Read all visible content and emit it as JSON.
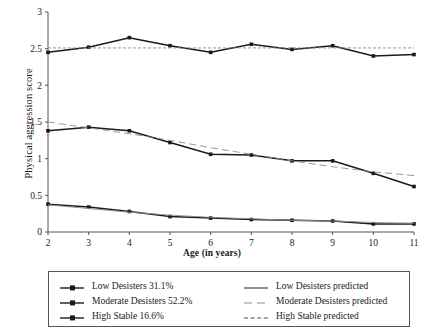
{
  "chart_data": {
    "type": "line",
    "title": "",
    "xlabel": "Age (in years)",
    "ylabel": "Physical aggression score",
    "x": [
      2,
      3,
      4,
      5,
      6,
      7,
      8,
      9,
      10,
      11
    ],
    "xticklabels": [
      "2",
      "3",
      "4",
      "5",
      "6",
      "7",
      "8",
      "9",
      "10",
      "11"
    ],
    "yticklabels": [
      "0",
      "0.5",
      "1",
      "1.5",
      "2",
      "2.5",
      "3"
    ],
    "yticks": [
      0,
      0.5,
      1,
      1.5,
      2,
      2.5,
      3
    ],
    "xlim": [
      2,
      11
    ],
    "ylim": [
      0,
      3
    ],
    "grid": false,
    "legend_position": "below-plot",
    "series": [
      {
        "name": "Low Desisters 31.1%",
        "style": "solid-with-markers",
        "marker": "square",
        "color": "#1a1a1a",
        "values": [
          0.38,
          0.34,
          0.28,
          0.21,
          0.19,
          0.17,
          0.16,
          0.15,
          0.11,
          0.11
        ]
      },
      {
        "name": "Moderate Desisters 52.2%",
        "style": "solid-with-markers",
        "marker": "square",
        "color": "#1a1a1a",
        "values": [
          1.38,
          1.43,
          1.38,
          1.22,
          1.06,
          1.05,
          0.97,
          0.97,
          0.8,
          0.62
        ]
      },
      {
        "name": "High Stable 16.6%",
        "style": "solid-with-markers",
        "marker": "square",
        "color": "#1a1a1a",
        "values": [
          2.45,
          2.52,
          2.65,
          2.54,
          2.45,
          2.56,
          2.49,
          2.54,
          2.4,
          2.42
        ]
      },
      {
        "name": "Low Desisters predicted",
        "style": "solid-thin",
        "color": "#8c8c8c",
        "values": [
          0.37,
          0.32,
          0.27,
          0.23,
          0.2,
          0.18,
          0.16,
          0.15,
          0.13,
          0.12
        ]
      },
      {
        "name": "Moderate Desisters predicted",
        "style": "dashed-long",
        "color": "#8c8c8c",
        "values": [
          1.5,
          1.42,
          1.34,
          1.25,
          1.15,
          1.06,
          0.97,
          0.89,
          0.82,
          0.77
        ]
      },
      {
        "name": "High Stable predicted",
        "style": "dashed-short",
        "color": "#8c8c8c",
        "values": [
          2.51,
          2.51,
          2.51,
          2.51,
          2.51,
          2.51,
          2.51,
          2.51,
          2.51,
          2.51
        ]
      }
    ]
  },
  "axis": {
    "ylabel": "Physical aggression score",
    "xlabel": "Age (in years)",
    "yticks": [
      "3",
      "2.5",
      "2",
      "1.5",
      "1",
      "0.5",
      "0"
    ],
    "xticks": [
      "2",
      "3",
      "4",
      "5",
      "6",
      "7",
      "8",
      "9",
      "10",
      "11"
    ]
  },
  "legend": {
    "left_column": [
      {
        "label": "Low Desisters 31.1%",
        "key": "line-marker-key"
      },
      {
        "label": "Moderate Desisters 52.2%",
        "key": "line-marker-key"
      },
      {
        "label": "High Stable 16.6%",
        "key": "line-marker-key"
      }
    ],
    "right_column": [
      {
        "label": "Low Desisters predicted",
        "key": "solid-line-key"
      },
      {
        "label": "Moderate Desisters predicted",
        "key": "long-dash-line-key"
      },
      {
        "label": "High Stable predicted",
        "key": "short-dash-line-key"
      }
    ]
  }
}
